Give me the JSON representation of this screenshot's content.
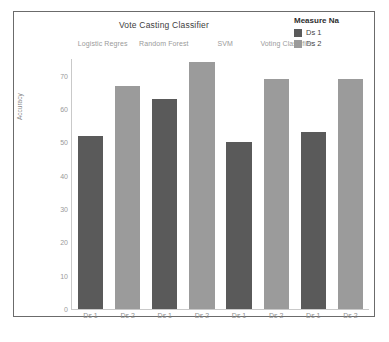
{
  "chart": {
    "title": "Vote Casting Classifier",
    "y_axis_label": "Accuracy",
    "group_headers": [
      "Logistic Regres",
      "Random Forest",
      "SVM",
      "Voting Classifier"
    ],
    "y_ticks": [
      "70",
      "60",
      "50",
      "40",
      "30",
      "20",
      "10",
      "0"
    ],
    "x_tick_labels": [
      "Ds 1",
      "Ds 2",
      "Ds 1",
      "Ds 2",
      "Ds 1",
      "Ds 2",
      "Ds 1",
      "Ds 2"
    ],
    "colors": {
      "ds1": "#5a5a5a",
      "ds2": "#9b9b9b",
      "frame_border": "#6b6b6b",
      "axis": "#c9c9c9",
      "tick_text": "#9a9a9a",
      "title_text": "#3d3d3d",
      "background": "#ffffff"
    }
  },
  "legend": {
    "title": "Measure Na",
    "items": [
      {
        "label": "Ds 1",
        "color": "#5a5a5a"
      },
      {
        "label": "Ds 2",
        "color": "#9b9b9b"
      }
    ]
  },
  "chart_data": {
    "type": "bar",
    "title": "Vote Casting Classifier",
    "xlabel": "",
    "ylabel": "Accuracy",
    "ylim": [
      0,
      75
    ],
    "grid": false,
    "legend_position": "top-right",
    "legend_title": "Measure Na",
    "categories": [
      "Logistic Regres",
      "Random Forest",
      "SVM",
      "Voting Classifier"
    ],
    "bar_labels": [
      "Ds 1",
      "Ds 2",
      "Ds 1",
      "Ds 2",
      "Ds 1",
      "Ds 2",
      "Ds 1",
      "Ds 2"
    ],
    "series": [
      {
        "name": "Ds 1",
        "color": "#5a5a5a",
        "values": [
          52,
          63,
          50,
          53
        ]
      },
      {
        "name": "Ds 2",
        "color": "#9b9b9b",
        "values": [
          67,
          74,
          69,
          69
        ]
      }
    ],
    "bars": [
      {
        "group": "Logistic Regres",
        "series": "Ds 1",
        "value": 52
      },
      {
        "group": "Logistic Regres",
        "series": "Ds 2",
        "value": 67
      },
      {
        "group": "Random Forest",
        "series": "Ds 1",
        "value": 63
      },
      {
        "group": "Random Forest",
        "series": "Ds 2",
        "value": 74
      },
      {
        "group": "SVM",
        "series": "Ds 1",
        "value": 50
      },
      {
        "group": "SVM",
        "series": "Ds 2",
        "value": 69
      },
      {
        "group": "Voting Classifier",
        "series": "Ds 1",
        "value": 53
      },
      {
        "group": "Voting Classifier",
        "series": "Ds 2",
        "value": 69
      }
    ],
    "y_ticks": [
      70,
      60,
      50,
      40,
      30,
      20,
      10,
      0
    ]
  }
}
